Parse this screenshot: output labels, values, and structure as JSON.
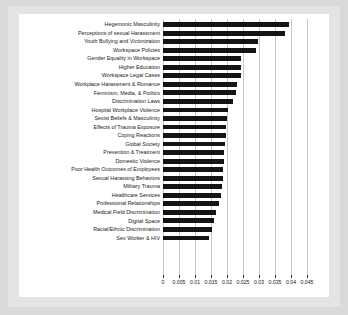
{
  "figure": {
    "frame_color": "#d9d9d9",
    "canvas_color": "#ffffff",
    "bar_color": "#141414",
    "grid_color": "#c8c8c8"
  },
  "chart_data": {
    "type": "bar",
    "orientation": "horizontal",
    "title": "",
    "xlabel": "",
    "ylabel": "",
    "grid": true,
    "legend": false,
    "xlim": [
      0,
      0.045
    ],
    "xticks": [
      0,
      0.005,
      0.01,
      0.015,
      0.02,
      0.025,
      0.03,
      0.035,
      0.04,
      0.045
    ],
    "xticklabels": [
      "0",
      "0.005",
      "0.01",
      "0.015",
      "0.02",
      "0.025",
      "0.03",
      "0.035",
      "0.04",
      "0.045"
    ],
    "categories": [
      "Hegemonic Masculinity",
      "Perceptions of sexual Harassment",
      "Youth Bullying and Victimization",
      "Workspace Policies",
      "Gender Equality in Workspace",
      "Higher Education",
      "Workspace Legal Cases",
      "Workplace Harassment & Romance",
      "Feminism, Media, & Politics",
      "Discrimination Laws",
      "Hospital Workplace Violence",
      "Sexist Beliefs & Masculinity",
      "Effects of Trauma Exposure",
      "Coping Reactions",
      "Global Society",
      "Prevention & Treatment",
      "Domestic Violence",
      "Poor Health Outcomes of Employees",
      "Sexual Harassing Behaviors",
      "Military Trauma",
      "Healthcare Services",
      "Professional Relationships",
      "Medical Field Discrimination",
      "Digital Space",
      "Racial/Ethnic Discrimination",
      "Sex Worker & HIV"
    ],
    "values": [
      0.0393,
      0.0381,
      0.0297,
      0.029,
      0.0245,
      0.0244,
      0.0243,
      0.023,
      0.0228,
      0.022,
      0.0202,
      0.02,
      0.0198,
      0.0196,
      0.0194,
      0.0192,
      0.019,
      0.0188,
      0.0186,
      0.0184,
      0.0182,
      0.0175,
      0.0165,
      0.016,
      0.0152,
      0.0145
    ]
  }
}
